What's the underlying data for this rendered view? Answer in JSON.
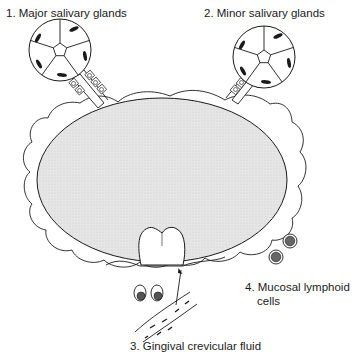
{
  "diagram": {
    "type": "anatomical-schematic",
    "labels": [
      {
        "id": 1,
        "text": "1.  Major salivary glands"
      },
      {
        "id": 2,
        "text": "2.  Minor salivary glands"
      },
      {
        "id": 3,
        "text": "3.  Gingival crevicular fluid"
      },
      {
        "id": 4,
        "text_line1": "4.  Mucosal lymphoid",
        "text_line2": "cells"
      }
    ],
    "colors": {
      "stroke": "#1a1a1a",
      "oral_cavity_fill": "#e4e4e4",
      "background": "#ffffff",
      "nucleus": "#555555"
    },
    "elements": {
      "oral_cavity": "stippled grey ellipse",
      "mucosa": "wavy outer border",
      "glands": [
        "major salivary gland acinus with duct",
        "minor salivary gland acinus with duct"
      ],
      "tooth": "molar crown emerging from gingiva",
      "arrow": "from blood vessel to gingival crevice",
      "blood_vessel": "capillary with cells",
      "lymphoid_cells": 4
    }
  }
}
